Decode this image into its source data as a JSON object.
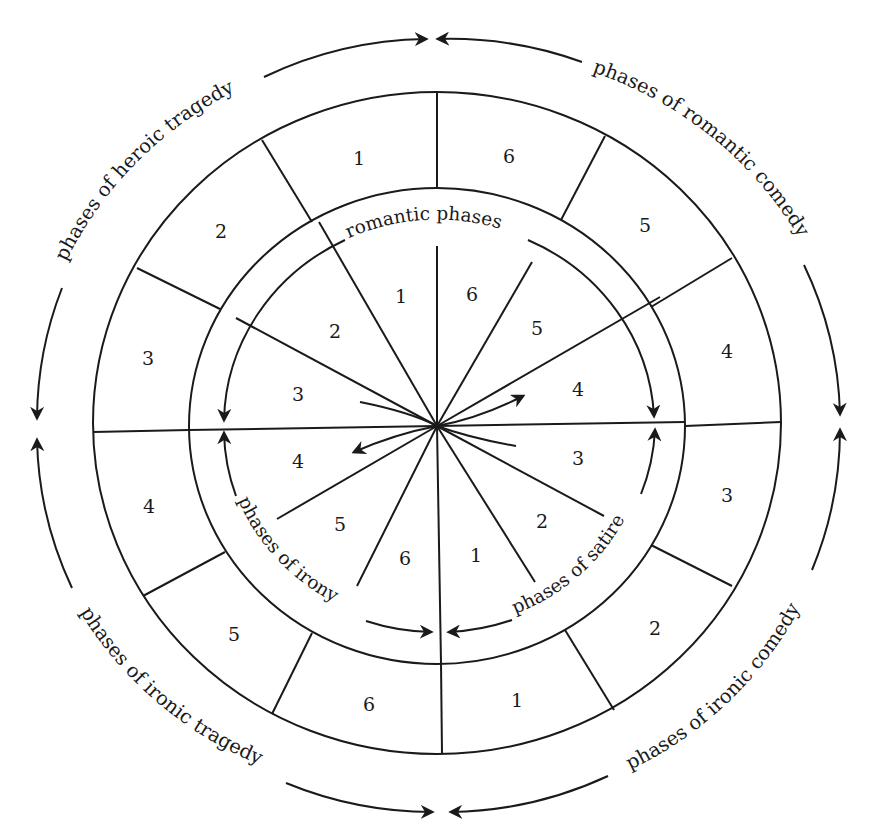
{
  "diagram": {
    "type": "cyclic-wheel",
    "center": {
      "x": 437,
      "y": 426
    },
    "sectors": 12,
    "outer_labels": [
      {
        "id": "heroic-tragedy",
        "text": "phases of heroic tragedy"
      },
      {
        "id": "romantic-comedy",
        "text": "phases of romantic comedy"
      },
      {
        "id": "ironic-comedy",
        "text": "phases of ironic comedy"
      },
      {
        "id": "ironic-tragedy",
        "text": "phases of ironic tragedy"
      }
    ],
    "inner_labels": [
      {
        "id": "romantic",
        "text": "romantic phases"
      },
      {
        "id": "irony",
        "text": "phases of irony"
      },
      {
        "id": "satire",
        "text": "phases of satire"
      }
    ],
    "outer_ring_numbers": [
      "1",
      "2",
      "3",
      "4",
      "5",
      "6",
      "1",
      "2",
      "3",
      "4",
      "5",
      "6"
    ],
    "outer_ring_numbers_order_note": "clockwise from top-left sector",
    "outer_ring": [
      {
        "sector": "top-left",
        "num": "1"
      },
      {
        "sector": "upper-left",
        "num": "2"
      },
      {
        "sector": "left-upper",
        "num": "3"
      },
      {
        "sector": "left-lower",
        "num": "4"
      },
      {
        "sector": "lower-left",
        "num": "5"
      },
      {
        "sector": "bottom-left",
        "num": "6"
      },
      {
        "sector": "bottom-right",
        "num": "1"
      },
      {
        "sector": "lower-right",
        "num": "2"
      },
      {
        "sector": "right-lower",
        "num": "3"
      },
      {
        "sector": "right-upper",
        "num": "4"
      },
      {
        "sector": "upper-right",
        "num": "5"
      },
      {
        "sector": "top-right",
        "num": "6"
      }
    ],
    "inner_ring": [
      {
        "sector": "top-left",
        "num": "1"
      },
      {
        "sector": "upper-left",
        "num": "2"
      },
      {
        "sector": "left-upper",
        "num": "3"
      },
      {
        "sector": "left-lower",
        "num": "4"
      },
      {
        "sector": "lower-left",
        "num": "5"
      },
      {
        "sector": "bottom-left",
        "num": "6"
      },
      {
        "sector": "bottom-right",
        "num": "1"
      },
      {
        "sector": "lower-right",
        "num": "2"
      },
      {
        "sector": "right-lower",
        "num": "3"
      },
      {
        "sector": "right-upper",
        "num": "4"
      },
      {
        "sector": "upper-right",
        "num": "5"
      },
      {
        "sector": "top-right",
        "num": "6"
      }
    ]
  }
}
